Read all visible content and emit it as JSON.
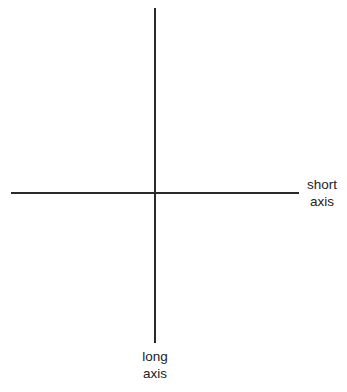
{
  "diagram": {
    "type": "perpendicular-axes",
    "line_color": "#2a2a2a",
    "background": "#ffffff",
    "short_axis": {
      "label_line1": "short",
      "label_line2": "axis",
      "orientation": "horizontal"
    },
    "long_axis": {
      "label_line1": "long",
      "label_line2": "axis",
      "orientation": "vertical"
    }
  }
}
